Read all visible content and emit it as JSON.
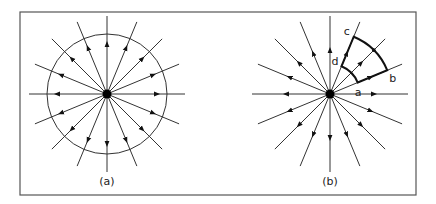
{
  "figure": {
    "frame": {
      "x": 20,
      "y": 12,
      "width": 396,
      "height": 183,
      "stroke": "#555555"
    },
    "panels": [
      {
        "id": "a",
        "caption": "(a)",
        "center": [
          107,
          94
        ],
        "ray_count": 16,
        "ray_length": 78,
        "arrow_distance": 50,
        "circle_radius": 60,
        "arrow_direction": "outward"
      },
      {
        "id": "b",
        "caption": "(b)",
        "center": [
          330,
          94
        ],
        "ray_count": 16,
        "ray_length": 78,
        "arrow_distance": 44,
        "arrow_direction": "outward",
        "surface": {
          "inner_radius": 30,
          "outer_radius": 62,
          "start_angle_deg": 22.5,
          "end_angle_deg": 67.5,
          "labels": {
            "a": "a",
            "b": "b",
            "c": "c",
            "d": "d"
          }
        }
      }
    ],
    "colors": {
      "line": "#333333",
      "charge": "#000000"
    }
  }
}
